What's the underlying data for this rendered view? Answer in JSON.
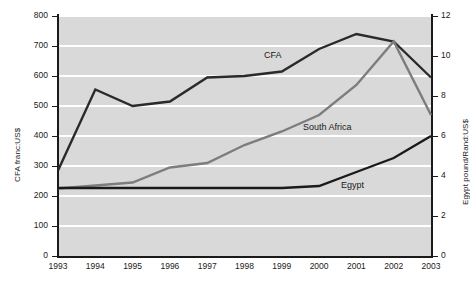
{
  "chart_data": {
    "type": "line",
    "title": "",
    "xlabel": "",
    "categories": [
      "1993",
      "1994",
      "1995",
      "1996",
      "1997",
      "1998",
      "1999",
      "2000",
      "2001",
      "2002",
      "2003"
    ],
    "grid": true,
    "legend_position": "inline-labels",
    "axes": {
      "left": {
        "label": "CFA franc:US$",
        "min": 0,
        "max": 800,
        "step": 100,
        "ticks": [
          "0",
          "100",
          "200",
          "300",
          "400",
          "500",
          "600",
          "700",
          "800"
        ]
      },
      "right": {
        "label": "Egypt pound/Rand:US$",
        "min": 0,
        "max": 12,
        "step": 2,
        "ticks": [
          "0",
          "2",
          "4",
          "6",
          "8",
          "10",
          "12"
        ]
      }
    },
    "series": [
      {
        "name": "CFA",
        "axis": "left",
        "color": "#2a2a2a",
        "width": 2.4,
        "values": [
          285,
          555,
          500,
          515,
          595,
          600,
          615,
          690,
          740,
          715,
          595
        ]
      },
      {
        "name": "South Africa",
        "axis": "left",
        "color": "#7d7d7d",
        "width": 2.4,
        "values": [
          225,
          235,
          245,
          295,
          310,
          370,
          415,
          470,
          570,
          715,
          470
        ]
      },
      {
        "name": "Egypt",
        "axis": "right",
        "color": "#1a1a1a",
        "width": 2.4,
        "values": [
          3.4,
          3.4,
          3.4,
          3.4,
          3.4,
          3.4,
          3.4,
          3.5,
          4.2,
          4.9,
          6.0
        ]
      }
    ],
    "annotations": [
      {
        "text": "CFA",
        "x_px": 264,
        "y_px": 50
      },
      {
        "text": "South Africa",
        "x_px": 303,
        "y_px": 122
      },
      {
        "text": "Egypt",
        "x_px": 341,
        "y_px": 180
      }
    ]
  }
}
